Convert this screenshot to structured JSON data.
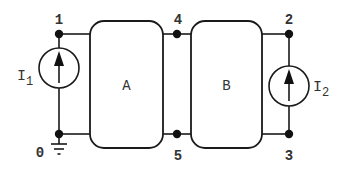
{
  "diagram": {
    "type": "circuit",
    "nodes": [
      {
        "id": "0",
        "label": "0",
        "note": "ground"
      },
      {
        "id": "1",
        "label": "1"
      },
      {
        "id": "2",
        "label": "2"
      },
      {
        "id": "3",
        "label": "3"
      },
      {
        "id": "4",
        "label": "4"
      },
      {
        "id": "5",
        "label": "5"
      }
    ],
    "blocks": [
      {
        "id": "A",
        "label": "A",
        "ports": [
          "1",
          "0",
          "4",
          "5"
        ]
      },
      {
        "id": "B",
        "label": "B",
        "ports": [
          "4",
          "5",
          "2",
          "3"
        ]
      }
    ],
    "sources": [
      {
        "id": "I1",
        "label_main": "I",
        "label_sub": "1",
        "type": "current",
        "from": "0",
        "to": "1",
        "direction": "up"
      },
      {
        "id": "I2",
        "label_main": "I",
        "label_sub": "2",
        "type": "current",
        "from": "3",
        "to": "2",
        "direction": "up"
      }
    ],
    "ground_node": "0"
  },
  "labels": {
    "node0": "0",
    "node1": "1",
    "node2": "2",
    "node3": "3",
    "node4": "4",
    "node5": "5",
    "blockA": "A",
    "blockB": "B",
    "i1_main": "I",
    "i1_sub": "1",
    "i2_main": "I",
    "i2_sub": "2"
  }
}
